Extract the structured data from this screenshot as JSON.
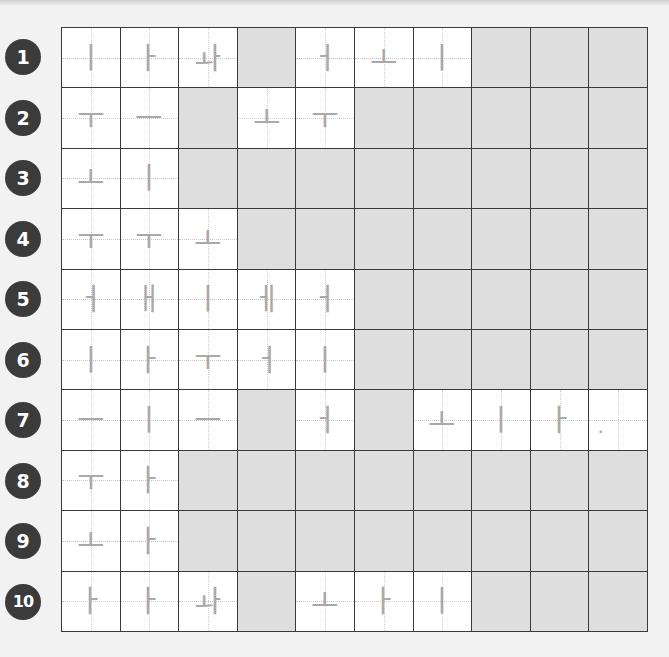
{
  "worksheet": {
    "rows": [
      {
        "number": "1",
        "cells": [
          "ㅣ",
          "ㅏ",
          "ㅘ",
          "",
          "ㅓ",
          "ㅗ",
          "ㅣ",
          "",
          "",
          ""
        ]
      },
      {
        "number": "2",
        "cells": [
          "ㅜ",
          "ㅡ",
          "",
          "ㅗ",
          "ㅜ",
          "",
          "",
          "",
          "",
          ""
        ]
      },
      {
        "number": "3",
        "cells": [
          "ㅗ",
          "ㅣ",
          "",
          "",
          "",
          "",
          "",
          "",
          "",
          ""
        ]
      },
      {
        "number": "4",
        "cells": [
          "ㅜ",
          "ㅜ",
          "ㅗ",
          "",
          "",
          "",
          "",
          "",
          "",
          ""
        ]
      },
      {
        "number": "5",
        "cells": [
          "ㅓ",
          "ㅐ",
          "ㅣ",
          "ㅔ",
          "ㅓ",
          "",
          "",
          "",
          "",
          ""
        ]
      },
      {
        "number": "6",
        "cells": [
          "ㅣ",
          "ㅏ",
          "ㅜ",
          "ㅓ",
          "ㅣ",
          "",
          "",
          "",
          "",
          ""
        ]
      },
      {
        "number": "7",
        "cells": [
          "ㅡ",
          "ㅣ",
          "ㅡ",
          "",
          "ㅓ",
          "",
          "ㅗ",
          "ㅣ",
          "ㅏ",
          "."
        ]
      },
      {
        "number": "8",
        "cells": [
          "ㅜ",
          "ㅏ",
          "",
          "",
          "",
          "",
          "",
          "",
          "",
          ""
        ]
      },
      {
        "number": "9",
        "cells": [
          "ㅗ",
          "ㅏ",
          "",
          "",
          "",
          "",
          "",
          "",
          "",
          ""
        ]
      },
      {
        "number": "10",
        "cells": [
          "ㅏ",
          "ㅏ",
          "ㅘ",
          "",
          "ㅗ",
          "ㅏ",
          "ㅣ",
          "",
          "",
          ""
        ]
      }
    ],
    "blank_mask": [
      [
        0,
        0,
        0,
        1,
        0,
        0,
        0,
        1,
        1,
        1
      ],
      [
        0,
        0,
        1,
        0,
        0,
        1,
        1,
        1,
        1,
        1
      ],
      [
        0,
        0,
        1,
        1,
        1,
        1,
        1,
        1,
        1,
        1
      ],
      [
        0,
        0,
        0,
        1,
        1,
        1,
        1,
        1,
        1,
        1
      ],
      [
        0,
        0,
        0,
        0,
        0,
        1,
        1,
        1,
        1,
        1
      ],
      [
        0,
        0,
        0,
        0,
        0,
        1,
        1,
        1,
        1,
        1
      ],
      [
        0,
        0,
        0,
        1,
        0,
        1,
        0,
        0,
        0,
        0
      ],
      [
        0,
        0,
        1,
        1,
        1,
        1,
        1,
        1,
        1,
        1
      ],
      [
        0,
        0,
        1,
        1,
        1,
        1,
        1,
        1,
        1,
        1
      ],
      [
        0,
        0,
        0,
        1,
        0,
        0,
        0,
        1,
        1,
        1
      ]
    ],
    "colors": {
      "badge": "#3b3b3b",
      "blank_cell": "#dedede",
      "stroke": "#a9a9a9",
      "grid_line": "#3a3a3a"
    }
  }
}
